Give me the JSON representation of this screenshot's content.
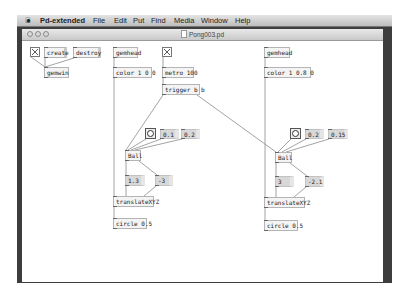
{
  "menubar": {
    "apple_icon": "apple-logo",
    "app_name": "Pd-extended",
    "items": [
      "File",
      "Edit",
      "Put",
      "Find",
      "Media",
      "Window",
      "Help"
    ]
  },
  "window": {
    "title": "Pong003.pd",
    "controls": [
      "close",
      "minimize",
      "zoom"
    ]
  },
  "patch": {
    "objects": {
      "create_msg": "create",
      "destroy_msg": "destroy",
      "gemwin": "gemwin",
      "gemhead1": "gemhead",
      "color1": "color 1 0 0",
      "metro": "metro 100",
      "trigger": "trigger b b",
      "num1a": "0.1",
      "num1b": "0.2",
      "ball1": "Ball",
      "num1c": "1.3",
      "num1d": "-3",
      "translate1": "translateXYZ",
      "circle1": "circle 0.5",
      "gemhead2": "gemhead",
      "color2": "color 1 0.8 0",
      "num2a": "0.2",
      "num2b": "0.15",
      "ball2": "Ball",
      "num2c": "3",
      "num2d": "-2.1",
      "translate2": "translateXYZ",
      "circle2": "circle 0.5"
    }
  }
}
